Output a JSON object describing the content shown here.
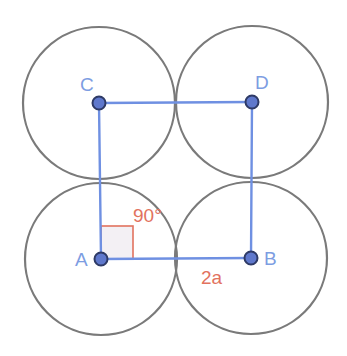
{
  "diagram": {
    "colors": {
      "circle_stroke": "#7a7a7a",
      "segment": "#6f90e2",
      "point_fill": "#5f78cc",
      "point_stroke": "#2e3a66",
      "point_label": "#7d9de2",
      "annotation": "#e2725e",
      "right_angle_fill": "#f3f0f4"
    },
    "circle_radius_px": 76,
    "points": [
      {
        "id": "A",
        "label": "A",
        "x": 101,
        "y": 259
      },
      {
        "id": "B",
        "label": "B",
        "x": 251,
        "y": 258
      },
      {
        "id": "C",
        "label": "C",
        "x": 99,
        "y": 103
      },
      {
        "id": "D",
        "label": "D",
        "x": 252,
        "y": 102
      }
    ],
    "segments": [
      [
        "A",
        "B"
      ],
      [
        "A",
        "C"
      ],
      [
        "C",
        "D"
      ],
      [
        "D",
        "B"
      ]
    ],
    "annotations": {
      "angle_label": "90°",
      "side_label": "2a"
    }
  }
}
